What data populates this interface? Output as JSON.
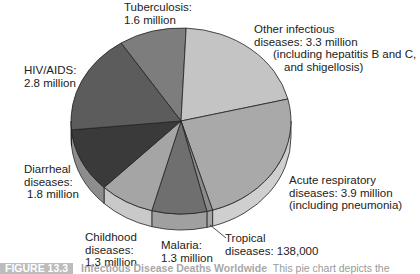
{
  "chart_data": {
    "type": "pie",
    "style": "3d",
    "title": "Infectious Disease Deaths Worldwide",
    "units": "deaths",
    "slices": [
      {
        "label": "Tuberculosis",
        "value_text": "1.6 million",
        "value": 1.6,
        "color": "#7d7d7d",
        "side": "#9a9a9a"
      },
      {
        "label": "Other infectious diseases",
        "value_text": "3.3 million",
        "note": "(including hepatitis B and C, and shigellosis)",
        "value": 3.3,
        "color": "#c4c4c4",
        "side": "#d6d6d6"
      },
      {
        "label": "Acute respiratory diseases",
        "value_text": "3.9 million",
        "note": "(including pneumonia)",
        "value": 3.9,
        "color": "#a9a9a9",
        "side": "#cfcfcf"
      },
      {
        "label": "Tropical diseases",
        "value_text": "138,000",
        "value": 0.138,
        "color": "#8a8a8a",
        "side": "#a6a6a6"
      },
      {
        "label": "Malaria",
        "value_text": "1.3 million",
        "value": 1.3,
        "color": "#6f6f6f",
        "side": "#a0a0a0"
      },
      {
        "label": "Childhood diseases",
        "value_text": "1.3 million",
        "value": 1.3,
        "color": "#a5a5a5",
        "side": "#c9c9c9"
      },
      {
        "label": "Diarrheal diseases",
        "value_text": "1.8 million",
        "value": 1.8,
        "color": "#3a3a3a",
        "side": "#8d8d8d"
      },
      {
        "label": "HIV/AIDS",
        "value_text": "2.8 million",
        "value": 2.8,
        "color": "#5c5c5c",
        "side": "#7a7a7a"
      }
    ],
    "legend": "none (direct labels)"
  },
  "labels": {
    "tb": {
      "l1": "Tuberculosis:",
      "l2": "1.6 million"
    },
    "other": {
      "l1": "Other infectious",
      "l2": "diseases: 3.3 million",
      "l3": "(including hepatitis B and C,",
      "l4": "and shigellosis)"
    },
    "hiv": {
      "l1": "HIV/AIDS:",
      "l2": "2.8 million"
    },
    "diarrheal": {
      "l1": "Diarrheal",
      "l2": "diseases:",
      "l3": "1.8 million"
    },
    "acute": {
      "l1": "Acute respiratory",
      "l2": "diseases: 3.9 million",
      "l3": "(including pneumonia)"
    },
    "childhood": {
      "l1": "Childhood",
      "l2": "diseases:",
      "l3": "1.3 million"
    },
    "malaria": {
      "l1": "Malaria:",
      "l2": "1.3 million"
    },
    "tropical": {
      "l1": "Tropical",
      "l2": "diseases: 138,000"
    }
  },
  "caption": {
    "tag": "FIGURE 13.3",
    "title": "Infectious Disease Deaths Worldwide",
    "text": "This pie chart depicts the"
  },
  "geometry": {
    "cx": 181,
    "cy": 121,
    "rx": 110,
    "ry": 93,
    "depth": 16,
    "start_deg": -33
  }
}
